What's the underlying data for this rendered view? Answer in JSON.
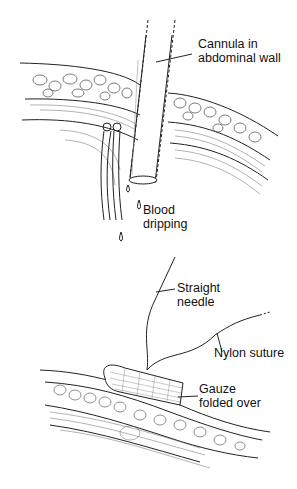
{
  "figure": {
    "top_panel": {
      "labels": {
        "cannula": [
          "Cannula in",
          "abdominal wall"
        ],
        "blood": [
          "Blood",
          "dripping"
        ]
      }
    },
    "bottom_panel": {
      "labels": {
        "needle": [
          "Straight",
          "needle"
        ],
        "suture": "Nylon suture",
        "gauze": [
          "Gauze",
          "folded over"
        ]
      }
    }
  }
}
